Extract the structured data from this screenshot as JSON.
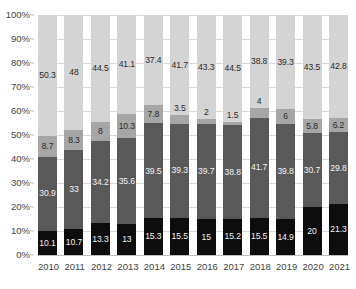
{
  "chart_data": {
    "type": "bar",
    "title": "",
    "subtitle": "",
    "xlabel": "",
    "ylabel": "",
    "stacked": true,
    "normalized_percent": true,
    "grid": true,
    "legend_position": "none",
    "ylim": [
      0,
      100
    ],
    "y_ticks": [
      "0%",
      "10%",
      "20%",
      "30%",
      "40%",
      "50%",
      "60%",
      "70%",
      "80%",
      "90%",
      "100%"
    ],
    "y_tick_values": [
      0,
      10,
      20,
      30,
      40,
      50,
      60,
      70,
      80,
      90,
      100
    ],
    "categories": [
      "2010",
      "2011",
      "2012",
      "2013",
      "2014",
      "2015",
      "2016",
      "2017",
      "2018",
      "2019",
      "2020",
      "2021"
    ],
    "series": [
      {
        "name": "segment-1",
        "color": "#0d0d0d",
        "values": [
          10.1,
          10.7,
          13.3,
          13,
          15.3,
          15.5,
          15,
          15.2,
          15.5,
          14.9,
          20,
          21.3
        ],
        "labels": [
          "10.1",
          "10.7",
          "13.3",
          "13",
          "15.3",
          "15.5",
          "15",
          "15.2",
          "15.5",
          "14.9",
          "20",
          "21.3"
        ]
      },
      {
        "name": "segment-2",
        "color": "#595959",
        "values": [
          30.9,
          33,
          34.2,
          35.6,
          39.5,
          39.3,
          39.7,
          38.8,
          41.7,
          39.8,
          30.7,
          29.8
        ],
        "labels": [
          "30.9",
          "33",
          "34.2",
          "35.6",
          "39.5",
          "39.3",
          "39.7",
          "38.8",
          "41.7",
          "39.8",
          "30.7",
          "29.8"
        ]
      },
      {
        "name": "segment-3",
        "color": "#a6a6a6",
        "values": [
          8.7,
          8.3,
          8,
          10.3,
          7.8,
          3.5,
          2,
          1.5,
          4,
          6,
          5.8,
          6.2
        ],
        "labels": [
          "8.7",
          "8.3",
          "8",
          "10.3",
          "7.8",
          "3.5",
          "2",
          "1.5",
          "4",
          "6",
          "5.8",
          "6.2"
        ]
      },
      {
        "name": "segment-4",
        "color": "#d4d4d4",
        "values": [
          50.3,
          48,
          44.5,
          41.1,
          37.4,
          41.7,
          43.3,
          44.5,
          38.8,
          39.3,
          43.5,
          42.8
        ],
        "labels": [
          "50.3",
          "48",
          "44.5",
          "41.1",
          "37.4",
          "41.7",
          "43.3",
          "44.5",
          "38.8",
          "39.3",
          "43.5",
          "42.8"
        ]
      }
    ]
  }
}
